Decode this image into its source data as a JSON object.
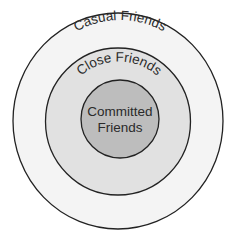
{
  "diagram": {
    "type": "concentric-circles",
    "rings": [
      {
        "label": "Casual Friends",
        "fill": "#f4f4f4",
        "stroke": "#222222"
      },
      {
        "label": "Close Friends",
        "fill": "#e1e1e1",
        "stroke": "#222222"
      },
      {
        "label_line1": "Committed",
        "label_line2": "Friends",
        "fill": "#bdbdbd",
        "stroke": "#222222"
      }
    ]
  }
}
